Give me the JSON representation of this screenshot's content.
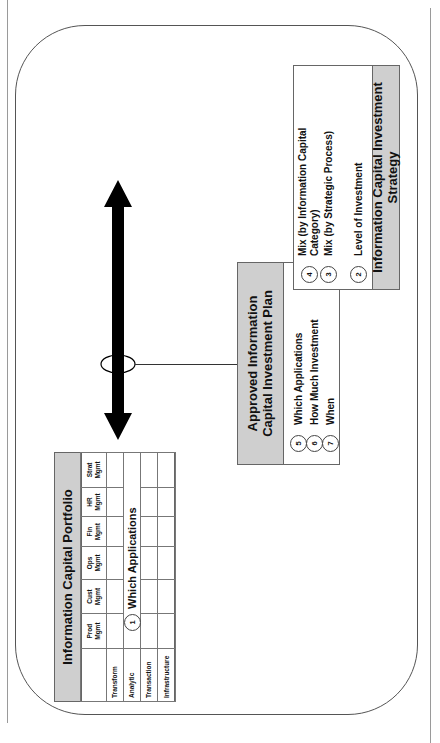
{
  "diagram": {
    "orientation": "rotated 90 degrees counter-clockwise",
    "portfolio": {
      "title": "Information Capital Portfolio",
      "columns": [
        "Prod\nMgmt",
        "Cust\nMgmt",
        "Ops\nMgmt",
        "Fin\nMgmt",
        "HR\nMgmt",
        "Strat\nMgmt"
      ],
      "column_labels": [
        "Prod Mgmt",
        "Cust Mgmt",
        "Ops Mgmt",
        "Fin Mgmt",
        "HR Mgmt",
        "Strat Mgmt"
      ],
      "rows": [
        "Transform",
        "Analytic",
        "Transaction",
        "Infrastructure"
      ],
      "callout": {
        "number": "1",
        "label": "Which Applications"
      }
    },
    "strategy": {
      "title": "Information Capital Investment Strategy",
      "items": [
        {
          "number": "2",
          "label": "Level of Investment"
        },
        {
          "number": "3",
          "label": "Mix (by Strategic Process)"
        },
        {
          "number": "4",
          "label": "Mix (by Information Capital Category)"
        }
      ]
    },
    "plan": {
      "title": "Approved Information Capital Investment Plan",
      "items": [
        {
          "number": "5",
          "label": "Which Applications"
        },
        {
          "number": "6",
          "label": "How Much Investment"
        },
        {
          "number": "7",
          "label": "When"
        }
      ]
    },
    "connector": {
      "type": "double-headed arrow",
      "color": "#000000"
    },
    "colors": {
      "header_fill": "#cfcfcf",
      "border": "#666666",
      "arrow": "#000000"
    }
  }
}
